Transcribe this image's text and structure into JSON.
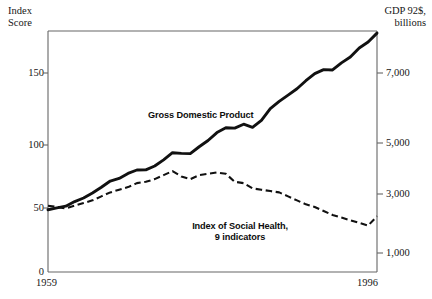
{
  "axes": {
    "left_caption": "Index\nScore",
    "right_caption": "GDP 92$,\nbillions",
    "left_ticks": [
      "0",
      "50",
      "100",
      "150"
    ],
    "right_ticks": [
      "1,000",
      "3,000",
      "5,000",
      "7,000"
    ],
    "x_start_label": "1959",
    "x_end_label": "1996"
  },
  "labels": {
    "gdp": "Gross Domestic Product",
    "social_health": "Index of Social Health,\n9 indicators"
  },
  "colors": {
    "ink": "#111111",
    "frame": "#555555",
    "background": "#ffffff"
  },
  "chart_data": {
    "type": "line",
    "title": "",
    "xlabel": "",
    "ylabel": "Index Score",
    "y2label": "GDP 92$, billions",
    "xlim": [
      1959,
      1996
    ],
    "ylim": [
      0,
      175
    ],
    "y2lim": [
      0,
      8500
    ],
    "grid": false,
    "legend": "inline-annotation",
    "x": [
      1959,
      1960,
      1961,
      1962,
      1963,
      1964,
      1965,
      1966,
      1967,
      1968,
      1969,
      1970,
      1971,
      1972,
      1973,
      1974,
      1975,
      1976,
      1977,
      1978,
      1979,
      1980,
      1981,
      1982,
      1983,
      1984,
      1985,
      1986,
      1987,
      1988,
      1989,
      1990,
      1991,
      1992,
      1993,
      1994,
      1995,
      1996
    ],
    "series": [
      {
        "name": "Gross Domestic Product",
        "axis": "right",
        "units": "billions of 1992 dollars",
        "style": "solid",
        "values": [
          2442,
          2502,
          2560,
          2715,
          2834,
          2999,
          3192,
          3399,
          3485,
          3653,
          3766,
          3772,
          3899,
          4105,
          4342,
          4320,
          4311,
          4541,
          4751,
          5015,
          5173,
          5162,
          5292,
          5189,
          5424,
          5814,
          6054,
          6264,
          6475,
          6743,
          6981,
          7113,
          7101,
          7337,
          7533,
          7836,
          8032,
          8329
        ]
      },
      {
        "name": "Index of Social Health, 9 indicators",
        "axis": "left",
        "units": "index score",
        "style": "dashed",
        "values": [
          50,
          49,
          48,
          50,
          52,
          54,
          57,
          60,
          62,
          64,
          67,
          68,
          70,
          73,
          76,
          72,
          70,
          73,
          74,
          75,
          74,
          68,
          67,
          63,
          62,
          61,
          60,
          57,
          54,
          51,
          49,
          46,
          43,
          41,
          39,
          37,
          35,
          42
        ]
      }
    ]
  }
}
